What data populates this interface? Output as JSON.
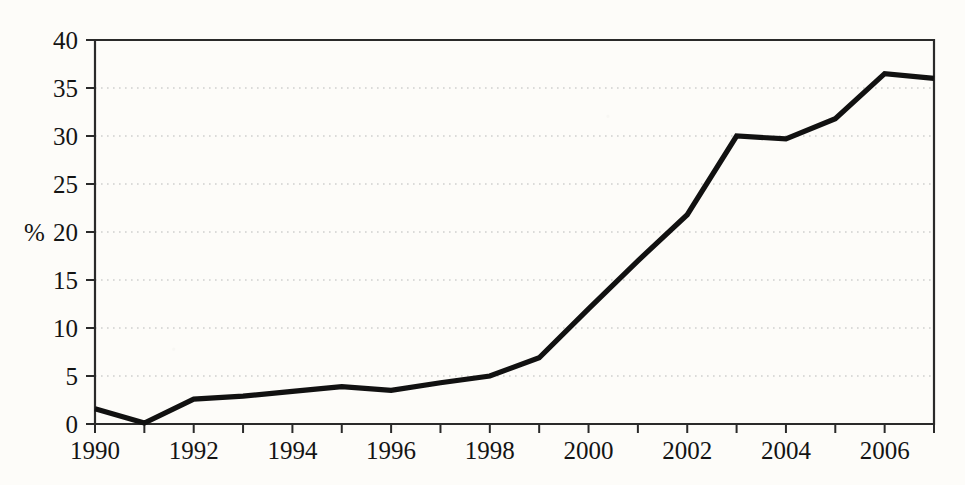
{
  "chart_data": {
    "type": "line",
    "title": "",
    "subtitle": "",
    "xlabel": "",
    "ylabel": "%",
    "x": [
      1990,
      1991,
      1992,
      1993,
      1994,
      1995,
      1996,
      1997,
      1998,
      1999,
      2000,
      2001,
      2002,
      2003,
      2004,
      2005,
      2006,
      2007
    ],
    "values": [
      1.6,
      0.1,
      2.6,
      2.9,
      3.4,
      3.9,
      3.5,
      4.3,
      5.0,
      6.9,
      12.0,
      17.0,
      21.8,
      30.0,
      29.7,
      31.8,
      36.5,
      36.0
    ],
    "series": [
      {
        "name": "",
        "values": [
          1.6,
          0.1,
          2.6,
          2.9,
          3.4,
          3.9,
          3.5,
          4.3,
          5.0,
          6.9,
          12.0,
          17.0,
          21.8,
          30.0,
          29.7,
          31.8,
          36.5,
          36.0
        ]
      }
    ],
    "xlim": [
      1990,
      2007
    ],
    "ylim": [
      0,
      40
    ],
    "ytick_values": [
      0,
      5,
      10,
      15,
      20,
      25,
      30,
      35,
      40
    ],
    "ytick_labels": [
      "0",
      "5",
      "10",
      "15",
      "20",
      "25",
      "30",
      "35",
      "40"
    ],
    "xtick_values": [
      1990,
      1991,
      1992,
      1993,
      1994,
      1995,
      1996,
      1997,
      1998,
      1999,
      2000,
      2001,
      2002,
      2003,
      2004,
      2005,
      2006,
      2007
    ],
    "xtick_labels": [
      "1990",
      "",
      "1992",
      "",
      "1994",
      "",
      "1996",
      "",
      "1998",
      "",
      "2000",
      "",
      "2002",
      "",
      "2004",
      "",
      "2006",
      ""
    ],
    "xtick_labels_shown": [
      "1990",
      "1992",
      "1994",
      "1996",
      "1998",
      "2000",
      "2002",
      "2004",
      "2006"
    ],
    "grid": "horizontal-dotted",
    "legend": "none",
    "line_color": "#111111",
    "grid_color": "#b9b9b9",
    "frame_color": "#2a2a2a",
    "background_color": "#fdfcf9",
    "annotations": []
  },
  "figure": {
    "plot_left": 95,
    "plot_right": 934,
    "plot_top": 40,
    "plot_bottom": 424
  }
}
